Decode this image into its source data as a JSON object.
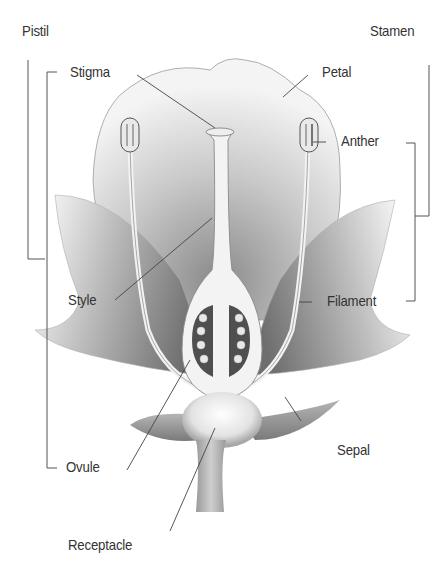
{
  "diagram": {
    "title_partially_visible": true,
    "groups": [
      {
        "name": "Pistil",
        "members": [
          "Stigma",
          "Style",
          "Ovule"
        ]
      },
      {
        "name": "Stamen",
        "members": [
          "Anther",
          "Filament"
        ]
      }
    ],
    "labels": {
      "pistil": "Pistil",
      "stamen": "Stamen",
      "stigma": "Stigma",
      "petal": "Petal",
      "anther": "Anther",
      "style": "Style",
      "filament": "Filament",
      "ovule": "Ovule",
      "sepal": "Sepal",
      "receptacle": "Receptacle"
    },
    "colors": {
      "line": "#444444",
      "shading_dark": "#5a5a5a",
      "shading_light": "#e6e6e6",
      "background": "#ffffff"
    }
  }
}
